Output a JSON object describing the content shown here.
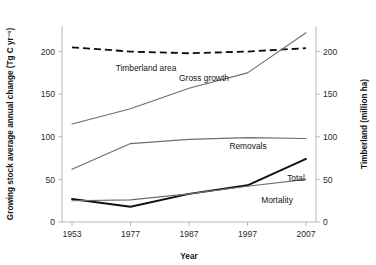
{
  "chart_data": {
    "type": "line",
    "title": "",
    "xlabel": "Year",
    "ylabel": "Growing stock average annual change (Tg C yr⁻¹)",
    "y2label": "Timberland (million ha)",
    "x": [
      1953,
      1977,
      1987,
      1997,
      2007
    ],
    "xtick_labels": [
      "1953",
      "1977",
      "1987",
      "1997",
      "2007"
    ],
    "xlim": [
      1953,
      2007
    ],
    "ylim": [
      0,
      230
    ],
    "ytick_labels": [
      "0",
      "50",
      "100",
      "150",
      "200"
    ],
    "yticks": [
      0,
      50,
      100,
      150,
      200
    ],
    "y2lim": [
      0,
      230
    ],
    "y2tick_labels": [
      "0",
      "50",
      "100",
      "150",
      "200"
    ],
    "y2ticks": [
      0,
      50,
      100,
      150,
      200
    ],
    "grid": false,
    "legend_position": "inline-labels",
    "series": [
      {
        "name": "Timberland area",
        "axis": "right",
        "style": "dashed",
        "color": "#0d0d0d",
        "values": [
          205,
          200,
          198,
          200,
          204
        ]
      },
      {
        "name": "Gross growth",
        "axis": "left",
        "style": "solid-thin",
        "color": "#6d6d6d",
        "values": [
          115,
          133,
          157,
          175,
          222
        ]
      },
      {
        "name": "Removals",
        "axis": "left",
        "style": "solid-thin",
        "color": "#6d6d6d",
        "values": [
          62,
          92,
          97,
          99,
          98
        ]
      },
      {
        "name": "Total",
        "axis": "left",
        "style": "solid-bold",
        "color": "#111111",
        "values": [
          27,
          18,
          33,
          43,
          74
        ]
      },
      {
        "name": "Mortality",
        "axis": "left",
        "style": "solid-thin",
        "color": "#6d6d6d",
        "values": [
          25,
          26,
          33,
          42,
          50
        ]
      }
    ],
    "annotations": [
      {
        "text": "Timberland area",
        "x": 146,
        "y": 71
      },
      {
        "text": "Gross growth",
        "x": 204,
        "y": 81
      },
      {
        "text": "Removals",
        "x": 248,
        "y": 149
      },
      {
        "text": "Total",
        "x": 296,
        "y": 181
      },
      {
        "text": "Mortality",
        "x": 277,
        "y": 203
      }
    ]
  }
}
